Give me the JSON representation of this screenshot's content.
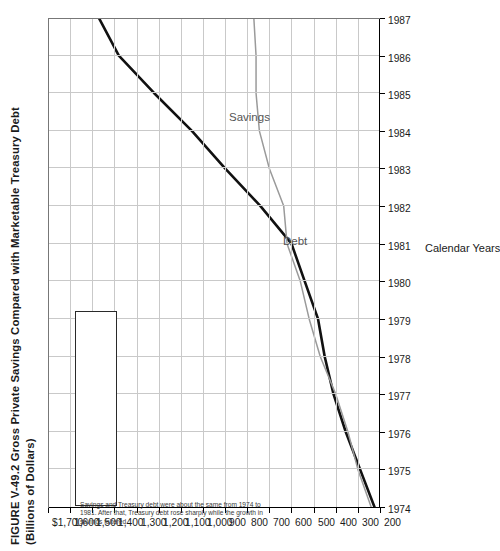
{
  "figure": {
    "title_line1": "FIGURE V-49.2  Gross Private Savings Compared with Marketable Treasury Debt",
    "title_line2": "(Billions of Dollars)"
  },
  "annotation": {
    "text": "Savings and Treasury debt were about the same from 1974 to 1981. After that, Treasury debt rose sharply while the growth in savings faltered"
  },
  "series_labels": {
    "debt": "Debt",
    "savings": "Savings"
  },
  "colors": {
    "debt": "#111111",
    "savings": "#9a9a9a",
    "grid": "#c9c9c9",
    "axis": "#000000"
  },
  "chart_data": {
    "type": "line",
    "title": "FIGURE V-49.2  Gross Private Savings Compared with Marketable Treasury Debt (Billions of Dollars)",
    "xlabel": "Calendar Years",
    "ylabel": "",
    "x": [
      1974,
      1975,
      1976,
      1977,
      1978,
      1979,
      1980,
      1981,
      1982,
      1983,
      1984,
      1985,
      1986,
      1987
    ],
    "xticklabels": [
      "1974",
      "1975",
      "1976",
      "1977",
      "1978",
      "1979",
      "1980",
      "1981",
      "1982",
      "1983",
      "1984",
      "1985",
      "1986",
      "1987"
    ],
    "yticklabels": [
      "$1,700",
      "1,600",
      "1,500",
      "1,400",
      "1,300",
      "1,200",
      "1,100",
      "1,000",
      "900",
      "800",
      "700",
      "600",
      "500",
      "400",
      "300",
      "200"
    ],
    "ytickvalues": [
      1700,
      1600,
      1500,
      1400,
      1300,
      1200,
      1100,
      1000,
      900,
      800,
      700,
      600,
      500,
      400,
      300,
      200
    ],
    "ylim": [
      200,
      1700
    ],
    "xlim": [
      1974,
      1987
    ],
    "grid": true,
    "legend": "inline-labels",
    "series": [
      {
        "name": "Debt",
        "color": "#111111",
        "values": [
          225,
          290,
          355,
          410,
          450,
          480,
          540,
          600,
          740,
          900,
          1050,
          1220,
          1380,
          1470
        ]
      },
      {
        "name": "Savings",
        "color": "#9a9a9a",
        "values": [
          240,
          300,
          345,
          400,
          470,
          520,
          560,
          620,
          635,
          700,
          745,
          760,
          760,
          770
        ]
      }
    ],
    "annotations": [
      {
        "text": "Savings and Treasury debt were about the same from 1974 to 1981. After that, Treasury debt rose sharply while the growth in savings faltered"
      }
    ]
  }
}
